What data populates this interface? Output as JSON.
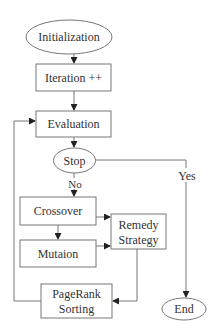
{
  "diagram": {
    "type": "flowchart",
    "nodes": [
      {
        "id": "init",
        "shape": "ellipse",
        "label": "Initialization"
      },
      {
        "id": "iter",
        "shape": "rect",
        "label": "Iteration ++"
      },
      {
        "id": "eval",
        "shape": "rect",
        "label": "Evaluation"
      },
      {
        "id": "stop",
        "shape": "ellipse",
        "label": "Stop"
      },
      {
        "id": "cross",
        "shape": "rect",
        "label": "Crossover"
      },
      {
        "id": "mut",
        "shape": "rect",
        "label": "Mutaion"
      },
      {
        "id": "remedy",
        "shape": "rect",
        "label_line1": "Remedy",
        "label_line2": "Strategy"
      },
      {
        "id": "pagerank",
        "shape": "rect",
        "label_line1": "PageRank",
        "label_line2": "Sorting"
      },
      {
        "id": "end",
        "shape": "ellipse",
        "label": "End"
      }
    ],
    "edge_labels": {
      "no": "No",
      "yes": "Yes"
    },
    "edges": [
      {
        "from": "init",
        "to": "iter"
      },
      {
        "from": "iter",
        "to": "eval"
      },
      {
        "from": "eval",
        "to": "stop"
      },
      {
        "from": "stop",
        "to": "cross",
        "label": "No"
      },
      {
        "from": "stop",
        "to": "end",
        "label": "Yes"
      },
      {
        "from": "cross",
        "to": "mut"
      },
      {
        "from": "cross",
        "to": "remedy"
      },
      {
        "from": "mut",
        "to": "remedy"
      },
      {
        "from": "remedy",
        "to": "pagerank"
      },
      {
        "from": "pagerank",
        "to": "eval"
      }
    ]
  }
}
